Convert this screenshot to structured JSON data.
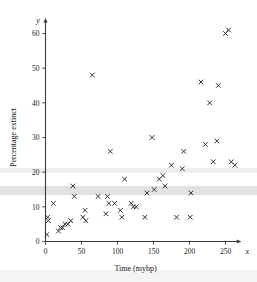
{
  "chart_data": {
    "type": "scatter",
    "title": "",
    "xlabel": "Time (mybp)",
    "ylabel": "Percentage extinct",
    "x_axis_symbol": "x",
    "y_axis_symbol": "y",
    "xlim": [
      -12,
      275
    ],
    "ylim": [
      -2,
      65
    ],
    "xticks": [
      0,
      50,
      100,
      150,
      200,
      250
    ],
    "yticks": [
      0,
      10,
      20,
      30,
      40,
      50,
      60
    ],
    "xticklabels": [
      "0",
      "50",
      "100",
      "150",
      "200",
      "250"
    ],
    "yticklabels": [
      "0",
      "10",
      "20",
      "30",
      "40",
      "50",
      "60"
    ],
    "grid": false,
    "legend": false,
    "marker": "x",
    "marker_color": "#2a2a2a",
    "series": [
      {
        "name": "Extinction data",
        "points": [
          [
            2,
            2
          ],
          [
            3,
            7
          ],
          [
            4,
            6
          ],
          [
            11,
            11
          ],
          [
            18,
            3
          ],
          [
            21,
            4
          ],
          [
            24,
            4
          ],
          [
            27,
            5
          ],
          [
            31,
            5
          ],
          [
            35,
            6
          ],
          [
            38,
            16
          ],
          [
            40,
            13
          ],
          [
            52,
            7
          ],
          [
            55,
            9
          ],
          [
            56,
            6
          ],
          [
            65,
            48
          ],
          [
            73,
            13
          ],
          [
            84,
            8
          ],
          [
            86,
            13
          ],
          [
            88,
            11
          ],
          [
            90,
            26
          ],
          [
            96,
            11
          ],
          [
            104,
            9
          ],
          [
            106,
            7
          ],
          [
            110,
            18
          ],
          [
            119,
            11
          ],
          [
            122,
            10
          ],
          [
            126,
            10
          ],
          [
            138,
            7
          ],
          [
            141,
            14
          ],
          [
            148,
            30
          ],
          [
            151,
            15
          ],
          [
            158,
            18
          ],
          [
            163,
            19
          ],
          [
            166,
            16
          ],
          [
            175,
            22
          ],
          [
            182,
            7
          ],
          [
            190,
            21
          ],
          [
            192,
            26
          ],
          [
            201,
            7
          ],
          [
            202,
            14
          ],
          [
            216,
            46
          ],
          [
            222,
            28
          ],
          [
            228,
            40
          ],
          [
            233,
            23
          ],
          [
            238,
            29
          ],
          [
            240,
            45
          ],
          [
            250,
            60
          ],
          [
            254,
            61
          ],
          [
            258,
            23
          ],
          [
            263,
            22
          ]
        ]
      }
    ]
  }
}
